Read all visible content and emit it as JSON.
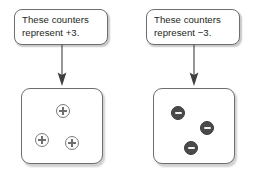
{
  "diagram": {
    "colors": {
      "border": "#6d6e70",
      "text": "#231f20",
      "positive_fill": "#fdfdfd",
      "positive_stroke": "#7b7c7e",
      "negative_fill": "#4a4a4c",
      "negative_mark": "#f2f2f2",
      "background": "#ffffff"
    },
    "panels": [
      {
        "id": "positive",
        "caption": "These counters\nrepresent +3.",
        "value": "+3",
        "arrow_icon": "arrow-down-icon",
        "counter_sign": "+",
        "counter_count": 3,
        "counters": [
          {
            "label": "plus-counter-1",
            "sign": "+",
            "x": 34,
            "y": 15
          },
          {
            "label": "plus-counter-2",
            "sign": "+",
            "x": 13,
            "y": 44
          },
          {
            "label": "plus-counter-3",
            "sign": "+",
            "x": 43,
            "y": 47
          }
        ]
      },
      {
        "id": "negative",
        "caption": "These counters\nrepresent −3.",
        "value": "−3",
        "arrow_icon": "arrow-down-icon",
        "counter_sign": "−",
        "counter_count": 3,
        "counters": [
          {
            "label": "minus-counter-1",
            "sign": "−",
            "x": 17,
            "y": 17
          },
          {
            "label": "minus-counter-2",
            "sign": "−",
            "x": 46,
            "y": 32
          },
          {
            "label": "minus-counter-3",
            "sign": "−",
            "x": 30,
            "y": 52
          }
        ]
      }
    ]
  }
}
